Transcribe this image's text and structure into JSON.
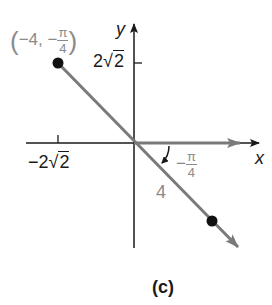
{
  "figure": {
    "caption": "(c)",
    "axes": {
      "x_label": "x",
      "y_label": "y",
      "x_tick_label": "−2",
      "x_tick_radicand": "2",
      "y_tick_label": "2",
      "y_tick_radicand": "2"
    },
    "point": {
      "label_open": "(",
      "label_r": "−4,",
      "label_theta_sign": "−",
      "label_theta_num": "π",
      "label_theta_den": "4",
      "label_close": ")"
    },
    "angle": {
      "sign": "−",
      "num": "π",
      "den": "4"
    },
    "ray_length_label": "4",
    "colors": {
      "axis": "#1a1a1a",
      "ray": "#7a7a7a",
      "point": "#111111",
      "annotation": "#8a8a8a"
    }
  }
}
